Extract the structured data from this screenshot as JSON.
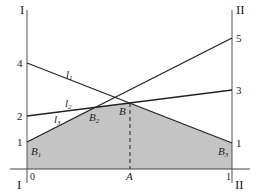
{
  "figure": {
    "type": "game-theory-lower-envelope",
    "axes": {
      "left_label": "I",
      "right_label": "II",
      "origin_left_label": "I",
      "origin_right_label": "II",
      "x_zero": "0",
      "x_one": "1",
      "point_A": "A"
    },
    "left_ticks": [
      "4",
      "2",
      "1"
    ],
    "right_ticks": [
      "5",
      "3",
      "1"
    ],
    "lines": [
      {
        "name": "l",
        "sub": "1",
        "left": 4,
        "right": 1
      },
      {
        "name": "l",
        "sub": "2",
        "left": 2,
        "right": 3
      },
      {
        "name": "l",
        "sub": "3",
        "left": 1,
        "right": 5
      }
    ],
    "points": [
      {
        "name": "B",
        "sub": "1"
      },
      {
        "name": "B",
        "sub": "2"
      },
      {
        "name": "B",
        "sub": ""
      },
      {
        "name": "B",
        "sub": "3"
      }
    ],
    "colors": {
      "shade": "#c4c4c4",
      "line": "#222222",
      "axis": "#444444"
    }
  }
}
